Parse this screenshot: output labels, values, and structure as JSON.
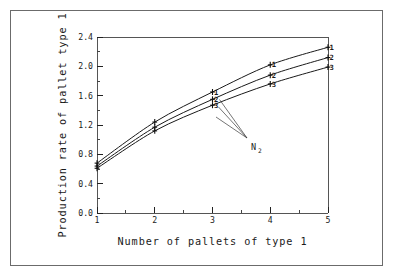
{
  "chart_data": {
    "type": "line",
    "title": "",
    "xlabel": "Number of pallets of type 1",
    "ylabel": "Production rate of pallet type 1",
    "x": [
      1,
      2,
      3,
      4,
      5
    ],
    "xlim": [
      1,
      5
    ],
    "ylim": [
      0.0,
      2.4
    ],
    "xticks": [
      "1",
      "2",
      "3",
      "4",
      "5"
    ],
    "yticks": [
      "0.0",
      "0.4",
      "0.8",
      "1.2",
      "1.6",
      "2.0",
      "2.4"
    ],
    "ytick_values": [
      0.0,
      0.4,
      0.8,
      1.2,
      1.6,
      2.0,
      2.4
    ],
    "grid": false,
    "legend": "inline-curve-labels",
    "marker": "plus",
    "series": [
      {
        "name": "1",
        "values": [
          0.68,
          1.24,
          1.65,
          2.02,
          2.26
        ]
      },
      {
        "name": "2",
        "values": [
          0.64,
          1.17,
          1.55,
          1.88,
          2.12
        ]
      },
      {
        "name": "3",
        "values": [
          0.61,
          1.12,
          1.47,
          1.76,
          1.99
        ]
      }
    ],
    "annotations": [
      {
        "text": "N",
        "subscript": "2",
        "points_to": [
          "1",
          "2",
          "3"
        ]
      }
    ]
  },
  "axis": {
    "x_title": "Number of pallets of type 1",
    "y_title": "Production rate of pallet type 1"
  },
  "annotation": {
    "n2_base": "N",
    "n2_sub": "2"
  },
  "colors": {
    "frame": "#6b6b6b",
    "axis": "#555555",
    "line": "#1a1a1a",
    "text": "#1a1a1a",
    "background": "#ffffff"
  }
}
